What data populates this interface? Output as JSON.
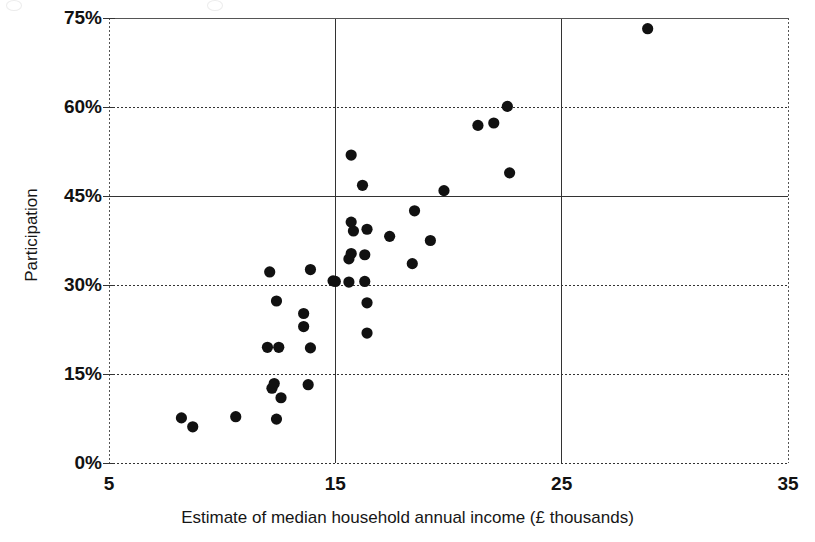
{
  "chart_data": {
    "type": "scatter",
    "title": "",
    "xlabel": "Estimate of median household annual income (£ thousands)",
    "ylabel": "Participation",
    "xlim": [
      5,
      35
    ],
    "ylim": [
      0,
      75
    ],
    "xticks": [
      "5",
      "15",
      "25",
      "35"
    ],
    "xtick_values": [
      5,
      15,
      25,
      35
    ],
    "yticks": [
      "0%",
      "15%",
      "30%",
      "45%",
      "60%",
      "75%"
    ],
    "ytick_values": [
      0,
      15,
      30,
      45,
      60,
      75
    ],
    "grid": "both",
    "grid_style": "dashed",
    "legend": "none",
    "marker": "filled-circle",
    "marker_color": "#111111",
    "marker_size": 9,
    "series": [
      {
        "name": "Local areas",
        "points": [
          [
            8.2,
            7.6
          ],
          [
            8.7,
            6.1
          ],
          [
            10.6,
            7.8
          ],
          [
            12.4,
            7.4
          ],
          [
            12.2,
            12.6
          ],
          [
            12.6,
            11.0
          ],
          [
            12.3,
            13.4
          ],
          [
            13.8,
            13.2
          ],
          [
            12.0,
            19.5
          ],
          [
            12.5,
            19.5
          ],
          [
            13.9,
            19.4
          ],
          [
            13.6,
            23.0
          ],
          [
            13.6,
            25.2
          ],
          [
            12.4,
            27.3
          ],
          [
            12.1,
            32.2
          ],
          [
            13.9,
            32.6
          ],
          [
            14.9,
            30.7
          ],
          [
            15.0,
            30.6
          ],
          [
            15.6,
            30.5
          ],
          [
            16.3,
            30.6
          ],
          [
            16.4,
            27.0
          ],
          [
            16.4,
            21.9
          ],
          [
            15.6,
            34.4
          ],
          [
            15.7,
            35.3
          ],
          [
            16.3,
            35.1
          ],
          [
            18.4,
            33.6
          ],
          [
            15.8,
            39.1
          ],
          [
            15.7,
            40.6
          ],
          [
            16.4,
            39.4
          ],
          [
            17.4,
            38.2
          ],
          [
            19.2,
            37.5
          ],
          [
            18.5,
            42.5
          ],
          [
            16.2,
            46.8
          ],
          [
            15.7,
            51.9
          ],
          [
            19.8,
            45.9
          ],
          [
            21.3,
            56.9
          ],
          [
            22.0,
            57.3
          ],
          [
            22.6,
            60.1
          ],
          [
            22.7,
            48.9
          ],
          [
            28.8,
            73.2
          ]
        ]
      }
    ]
  },
  "axis": {
    "y_title": "Participation",
    "x_title": "Estimate of median household annual income (£ thousands)"
  }
}
